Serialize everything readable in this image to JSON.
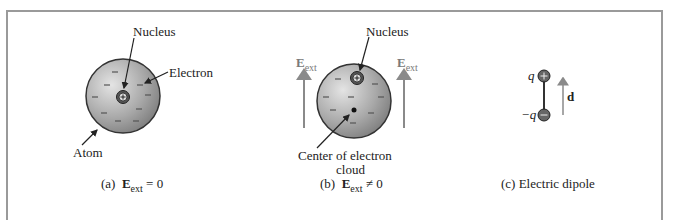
{
  "figure": {
    "panels": [
      {
        "id": "a",
        "caption_prefix": "(a)",
        "caption_symbol": "E",
        "caption_sub": "ext",
        "caption_rel": "= 0",
        "labels": {
          "nucleus": "Nucleus",
          "electron": "Electron",
          "atom": "Atom"
        }
      },
      {
        "id": "b",
        "caption_prefix": "(b)",
        "caption_symbol": "E",
        "caption_sub": "ext",
        "caption_rel": "≠ 0",
        "labels": {
          "nucleus": "Nucleus",
          "center_line1": "Center of electron",
          "center_line2": "cloud",
          "field_symbol": "E",
          "field_sub": "ext"
        }
      },
      {
        "id": "c",
        "caption": "(c)  Electric dipole",
        "labels": {
          "pos_charge": "q",
          "neg_charge": "−q",
          "dipole_vector": "d"
        }
      }
    ],
    "colors": {
      "frame": "#9a9a9a",
      "arrow_gray": "#8a8a8a",
      "sphere_dark": "#6e6e6e",
      "sphere_light": "#d8d8d8"
    }
  }
}
